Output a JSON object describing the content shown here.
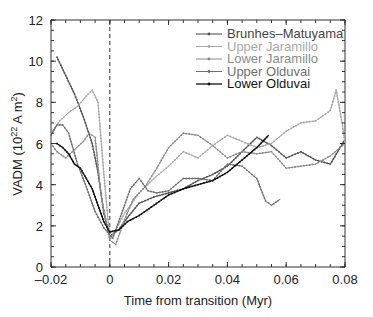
{
  "chart_data": {
    "type": "line",
    "title": "",
    "xlabel": "Time from transition (Myr)",
    "ylabel": "VADM (10^22 A m^2)",
    "xlim": [
      -0.02,
      0.08
    ],
    "ylim": [
      0,
      12
    ],
    "xticks": [
      "-0.02",
      "0",
      "0.02",
      "0.04",
      "0.06",
      "0.08"
    ],
    "xtick_values": [
      -0.02,
      0,
      0.02,
      0.04,
      0.06,
      0.08
    ],
    "yticks": [
      "0",
      "2",
      "4",
      "6",
      "8",
      "10",
      "12"
    ],
    "ytick_values": [
      0,
      2,
      4,
      6,
      8,
      10,
      12
    ],
    "grid": false,
    "legend_position": "upper right",
    "annotations": [
      {
        "type": "vline",
        "x": 0,
        "style": "dashed"
      }
    ],
    "series": [
      {
        "name": "Brunhes–Matuyama",
        "color": "#555555",
        "width": 1.1,
        "x": [
          -0.018,
          -0.015,
          -0.012,
          -0.009,
          -0.006,
          -0.004,
          -0.002,
          0,
          0.003,
          0.006,
          0.01,
          0.015,
          0.02,
          0.025,
          0.03,
          0.035,
          0.04,
          0.045,
          0.05,
          0.055,
          0.06,
          0.065,
          0.07,
          0.075,
          0.08
        ],
        "y": [
          10.2,
          9.3,
          8.4,
          7.3,
          6.0,
          4.6,
          2.6,
          1.5,
          1.8,
          2.4,
          3.1,
          3.4,
          3.6,
          3.8,
          4.2,
          4.5,
          4.9,
          5.6,
          6.3,
          5.9,
          5.3,
          5.6,
          5.2,
          5.0,
          6.2
        ]
      },
      {
        "name": "Upper Jaramillo",
        "color": "#a8a8a8",
        "width": 1.0,
        "x": [
          -0.02,
          -0.017,
          -0.014,
          -0.011,
          -0.008,
          -0.006,
          -0.004,
          -0.002,
          0,
          0.002,
          0.005,
          0.01,
          0.015,
          0.02,
          0.025,
          0.03,
          0.035,
          0.04,
          0.045,
          0.05,
          0.055,
          0.06,
          0.065,
          0.07,
          0.075,
          0.077,
          0.079,
          0.08
        ],
        "y": [
          6.5,
          7.1,
          7.5,
          7.8,
          8.3,
          8.6,
          8.0,
          4.5,
          1.3,
          1.8,
          2.6,
          3.6,
          4.3,
          4.9,
          5.6,
          5.3,
          5.9,
          6.4,
          6.1,
          5.8,
          6.0,
          6.6,
          7.0,
          7.1,
          7.6,
          8.6,
          7.0,
          6.0
        ]
      },
      {
        "name": "Lower Jaramillo",
        "color": "#8a8a8a",
        "width": 1.0,
        "x": [
          -0.02,
          -0.018,
          -0.015,
          -0.012,
          -0.009,
          -0.007,
          -0.005,
          -0.003,
          0,
          0.002,
          0.005,
          0.008,
          0.012,
          0.016,
          0.02,
          0.025,
          0.03,
          0.035,
          0.04,
          0.045,
          0.05,
          0.055,
          0.06,
          0.065,
          0.07,
          0.075,
          0.08
        ],
        "y": [
          6.0,
          5.6,
          5.3,
          5.7,
          6.1,
          6.5,
          6.3,
          3.5,
          1.3,
          1.1,
          2.3,
          3.3,
          3.9,
          4.8,
          5.8,
          6.5,
          6.4,
          5.9,
          5.3,
          5.6,
          5.5,
          5.6,
          4.8,
          4.9,
          5.0,
          5.4,
          6.0
        ]
      },
      {
        "name": "Upper Olduvai",
        "color": "#6e6e6e",
        "width": 1.0,
        "x": [
          -0.02,
          -0.018,
          -0.016,
          -0.014,
          -0.011,
          -0.008,
          -0.005,
          -0.002,
          0.001,
          0.004,
          0.007,
          0.01,
          0.013,
          0.016,
          0.02,
          0.025,
          0.03,
          0.035,
          0.04,
          0.045,
          0.05,
          0.053,
          0.055,
          0.058
        ],
        "y": [
          6.4,
          6.9,
          6.9,
          6.5,
          5.0,
          3.9,
          2.7,
          1.9,
          1.4,
          2.6,
          3.8,
          4.3,
          3.7,
          3.6,
          3.7,
          4.3,
          4.3,
          4.2,
          5.0,
          4.9,
          4.3,
          3.2,
          3.0,
          3.3
        ]
      },
      {
        "name": "Lower Olduvai",
        "color": "#111111",
        "width": 1.3,
        "x": [
          -0.018,
          -0.016,
          -0.014,
          -0.012,
          -0.01,
          -0.008,
          -0.006,
          -0.004,
          -0.002,
          0,
          0.003,
          0.006,
          0.01,
          0.015,
          0.02,
          0.025,
          0.03,
          0.035,
          0.04,
          0.045,
          0.05,
          0.054
        ],
        "y": [
          6.0,
          5.8,
          5.5,
          5.0,
          4.8,
          4.3,
          3.8,
          3.0,
          2.2,
          1.7,
          1.8,
          2.2,
          2.5,
          3.0,
          3.5,
          3.8,
          4.0,
          4.2,
          4.6,
          5.2,
          5.8,
          6.4
        ]
      }
    ]
  }
}
